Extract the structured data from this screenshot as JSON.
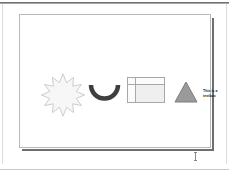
{
  "window": {
    "title": "Slide Editor",
    "background_color": "#ffffff",
    "top_rule_color": "#5c5c5c"
  },
  "slide": {
    "background_color": "#ffffff",
    "border_color": "#b9b9b9",
    "shadow_color": "#6f6f6f"
  },
  "shapes": [
    {
      "id": "star",
      "name": "explosion-star-shape",
      "kind": "star-burst",
      "fill": "#f7f7f7",
      "stroke": "#c6c6c6",
      "points": 12
    },
    {
      "id": "arc",
      "name": "arc-shape",
      "kind": "arc",
      "fill": "none",
      "stroke": "#3f3f3f",
      "stroke_width": 4
    },
    {
      "id": "table",
      "name": "table-shape",
      "kind": "table",
      "fill": "#efefef",
      "stroke": "#a8a8a8",
      "rows": 2,
      "columns": 2
    },
    {
      "id": "triangle",
      "name": "triangle-shape",
      "kind": "isosceles-triangle",
      "fill": "#9a9a9a",
      "stroke": "#7d7d7d"
    },
    {
      "id": "textbox",
      "name": "text-box-shape",
      "kind": "textbox",
      "text": "This is a\ntextbox",
      "color": "#1a1a1a"
    }
  ],
  "textbox": {
    "content": "This is a\ntextbox"
  },
  "cursor": {
    "type": "text-ibeam",
    "color": "#5a5a5a"
  }
}
